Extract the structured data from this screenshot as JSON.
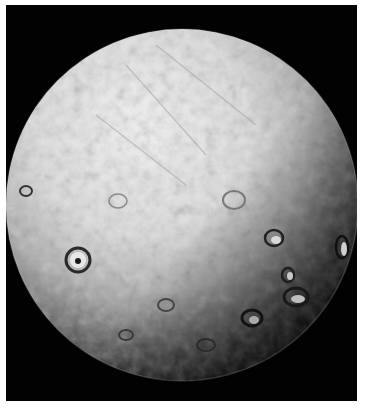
{
  "image": {
    "subject": "Cratered icy moon, full disc",
    "background_color": "#020202",
    "page_color": "#ffffff",
    "surface_colors": {
      "highlight": "#f2f2f2",
      "midtone": "#bdbdbd",
      "shadow": "#3a3a3a",
      "terminator": "#050505"
    },
    "disc": {
      "cx": 176,
      "cy": 200,
      "r": 176
    },
    "craters": [
      {
        "label": "large-crater-left",
        "cx": 72,
        "cy": 255,
        "r": 12
      },
      {
        "label": "crater-right-1",
        "cx": 268,
        "cy": 233,
        "r": 9
      },
      {
        "label": "crater-right-2",
        "cx": 282,
        "cy": 270,
        "r": 7
      },
      {
        "label": "crater-right-3",
        "cx": 288,
        "cy": 290,
        "r": 12
      },
      {
        "label": "crater-lower-1",
        "cx": 246,
        "cy": 313,
        "r": 10
      },
      {
        "label": "crater-limb-right",
        "cx": 336,
        "cy": 240,
        "r": 8
      },
      {
        "label": "crater-left-limb",
        "cx": 20,
        "cy": 185,
        "r": 6
      },
      {
        "label": "crater-center",
        "cx": 228,
        "cy": 195,
        "r": 10
      }
    ]
  }
}
